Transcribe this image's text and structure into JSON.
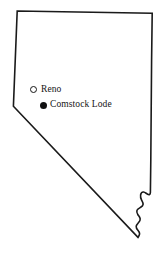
{
  "figure": {
    "kind": "map",
    "region_name": "Nevada",
    "background_color": "#ffffff",
    "outline_color": "#1a1a1a",
    "outline_width_px": 1.6
  },
  "map": {
    "places": [
      {
        "id": "reno",
        "label": "Reno",
        "marker": "open-circle-marker",
        "marker_style": "hollow",
        "marker_color": "#161616",
        "marker_fill": "#ffffff",
        "x": 33,
        "y": 89.5
      },
      {
        "id": "comstock-lode",
        "label": "Comstock Lode",
        "marker": "filled-circle-marker",
        "marker_style": "filled",
        "marker_color": "#111111",
        "marker_fill": "#111111",
        "x": 43,
        "y": 105
      }
    ]
  }
}
